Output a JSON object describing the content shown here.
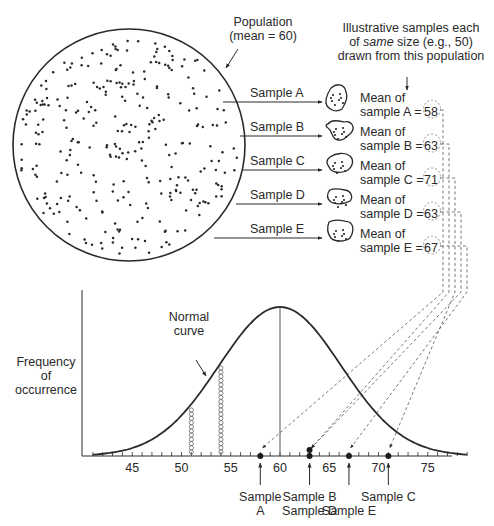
{
  "population": {
    "label_line1": "Population",
    "label_line2": "(mean = 60)",
    "mean": 60
  },
  "samples_header": {
    "line1": "Illustrative samples each",
    "line2_em": "same",
    "line2_pre": "of ",
    "line2_post": " size (e.g., 50)",
    "line3": "drawn from this population"
  },
  "samples": [
    {
      "id": "A",
      "arrow_label": "Sample A",
      "mean_line1": "Mean of",
      "mean_line2": "sample A =",
      "mean": 58,
      "axis_label_line1": "Sample",
      "axis_label_line2": "A"
    },
    {
      "id": "B",
      "arrow_label": "Sample B",
      "mean_line1": "Mean of",
      "mean_line2": "sample B =",
      "mean": 63,
      "axis_label_line1": "Sample B",
      "axis_label_line2": ""
    },
    {
      "id": "C",
      "arrow_label": "Sample C",
      "mean_line1": "Mean of",
      "mean_line2": "sample C =",
      "mean": 71,
      "axis_label_line1": "Sample C",
      "axis_label_line2": ""
    },
    {
      "id": "D",
      "arrow_label": "Sample D",
      "mean_line1": "Mean of",
      "mean_line2": "sample D =",
      "mean": 63,
      "axis_label_line1": "",
      "axis_label_line2": "Sample D"
    },
    {
      "id": "E",
      "arrow_label": "Sample E",
      "mean_line1": "Mean of",
      "mean_line2": "sample E =",
      "mean": 67,
      "axis_label_line1": "",
      "axis_label_line2": "Sample E"
    }
  ],
  "chart": {
    "ylabel_line1": "Frequency",
    "ylabel_line2": "of",
    "ylabel_line3": "occurrence",
    "curve_label_line1": "Normal",
    "curve_label_line2": "curve",
    "x_ticks": [
      45,
      50,
      55,
      60,
      65,
      70,
      75
    ],
    "x_min": 41,
    "x_max": 79,
    "highlight_columns": [
      51,
      54
    ]
  },
  "chart_data": {
    "type": "scatter",
    "title": "",
    "xlabel": "",
    "ylabel": "Frequency of occurrence",
    "x_ticks": [
      45,
      50,
      55,
      60,
      65,
      70,
      75
    ],
    "xlim": [
      41,
      79
    ],
    "curve": "normal, mean 60",
    "points": [
      {
        "label": "Sample A",
        "x": 58
      },
      {
        "label": "Sample B",
        "x": 63
      },
      {
        "label": "Sample C",
        "x": 71
      },
      {
        "label": "Sample D",
        "x": 63
      },
      {
        "label": "Sample E",
        "x": 67
      }
    ]
  },
  "colors": {
    "ink": "#2a2a2a",
    "dash": "#555555",
    "background": "#ffffff"
  }
}
